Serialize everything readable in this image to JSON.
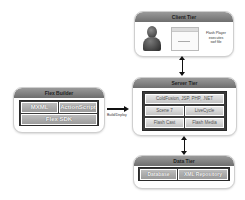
{
  "client_tier": {
    "title": "Client Tier",
    "note": "Flash Player executes swf file",
    "note_lines": [
      "Flash Player",
      "executes",
      "swf file"
    ]
  },
  "server_tier": {
    "title": "Server Tier",
    "cells": [
      "ColdFusion, JSP, PHP, .NET",
      "Scene 7",
      "LiveCycle",
      "Flash Cast",
      "Flash Media"
    ]
  },
  "data_tier": {
    "title": "Data Tier",
    "cells": [
      "Database",
      "XML Repository"
    ]
  },
  "flex_builder": {
    "title": "Flex Builder",
    "cells": [
      "MXML",
      "ActionScript",
      "Flex SDK"
    ]
  },
  "connectors": {
    "build_label": "Build/Deploy"
  },
  "colors": {
    "header": "#7f7f7f",
    "inner": "#3a3a3a",
    "cell": "#d6d6d6",
    "arrow": "#111111"
  }
}
